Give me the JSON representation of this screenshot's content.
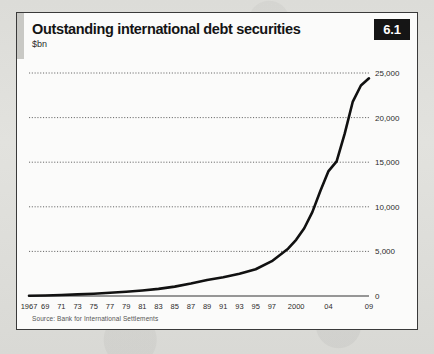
{
  "card": {
    "title": "Outstanding international debt securities",
    "units": "$bn",
    "badge": "6.1",
    "source": "Source: Bank for International Settlements"
  },
  "chart_data": {
    "type": "line",
    "title": "Outstanding international debt securities",
    "subtitle": "$bn",
    "xlabel": "",
    "ylabel": "$bn",
    "ylim": [
      0,
      25000
    ],
    "xlim": [
      1967,
      2009
    ],
    "grid": true,
    "legend": "none",
    "yticks": [
      0,
      5000,
      10000,
      15000,
      20000,
      25000
    ],
    "ytick_labels": [
      "0",
      "5,000",
      "10,000",
      "15,000",
      "20,000",
      "25,000"
    ],
    "xtick_labels": [
      "1967",
      "69",
      "71",
      "73",
      "75",
      "77",
      "79",
      "81",
      "83",
      "85",
      "87",
      "89",
      "91",
      "93",
      "95",
      "97",
      "2000",
      "04",
      "09"
    ],
    "xticks": [
      1967,
      1969,
      1971,
      1973,
      1975,
      1977,
      1979,
      1981,
      1983,
      1985,
      1987,
      1989,
      1991,
      1993,
      1995,
      1997,
      2000,
      2004,
      2009
    ],
    "series": [
      {
        "name": "Outstanding international debt securities",
        "color": "#111111",
        "x": [
          1967,
          1969,
          1971,
          1973,
          1975,
          1977,
          1979,
          1981,
          1983,
          1985,
          1987,
          1989,
          1991,
          1993,
          1995,
          1997,
          1998,
          1999,
          2000,
          2001,
          2002,
          2003,
          2004,
          2005,
          2006,
          2007,
          2008,
          2009
        ],
        "values": [
          30,
          60,
          110,
          180,
          260,
          360,
          480,
          620,
          800,
          1050,
          1400,
          1800,
          2100,
          2500,
          3000,
          3900,
          4600,
          5300,
          6300,
          7600,
          9400,
          11800,
          14000,
          15100,
          18200,
          21800,
          23600,
          24400
        ]
      }
    ]
  }
}
